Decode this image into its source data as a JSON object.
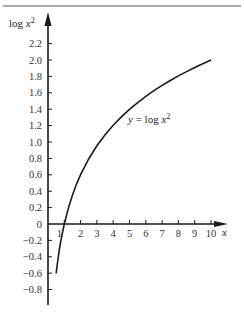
{
  "chart_data": {
    "type": "line",
    "title": "",
    "xlabel": "x",
    "ylabel": "log x²",
    "annotation": "y = log x²",
    "x_ticks": [
      1,
      2,
      3,
      4,
      5,
      6,
      7,
      8,
      9,
      10
    ],
    "x_tick_labels": [
      "1",
      "2",
      "3",
      "4",
      "5",
      "6",
      "7",
      "8",
      "9",
      "10"
    ],
    "y_ticks": [
      2.2,
      2.0,
      1.8,
      1.6,
      1.4,
      1.2,
      1.0,
      0.8,
      0.6,
      0.4,
      0.2,
      0,
      -0.2,
      -0.4,
      -0.6,
      -0.8
    ],
    "y_tick_labels": [
      "2.2",
      "2.0",
      "1.8",
      "1.6",
      "1.4",
      "1.2",
      "1.0",
      "0.8",
      "0.6",
      "0.4",
      "0.2",
      "0",
      "−0.2",
      "−0.4",
      "−0.6",
      "−0.8"
    ],
    "xlim": [
      0,
      10.5
    ],
    "ylim": [
      -0.95,
      2.35
    ],
    "grid": false,
    "series": [
      {
        "name": "y = log x²",
        "x": [
          0.5,
          0.6,
          0.7,
          0.8,
          0.9,
          1,
          1.25,
          1.5,
          1.75,
          2,
          2.5,
          3,
          3.5,
          4,
          4.5,
          5,
          5.5,
          6,
          6.5,
          7,
          7.5,
          8,
          8.5,
          9,
          9.5,
          10
        ],
        "values": [
          -0.602,
          -0.444,
          -0.31,
          -0.194,
          -0.092,
          0,
          0.194,
          0.352,
          0.486,
          0.602,
          0.796,
          0.954,
          1.088,
          1.204,
          1.306,
          1.398,
          1.481,
          1.556,
          1.626,
          1.69,
          1.75,
          1.806,
          1.859,
          1.908,
          1.955,
          2.0
        ]
      }
    ]
  },
  "colors": {
    "axis": "#1a1a1a",
    "curve": "#1a1a1a",
    "rule": "#555555"
  }
}
